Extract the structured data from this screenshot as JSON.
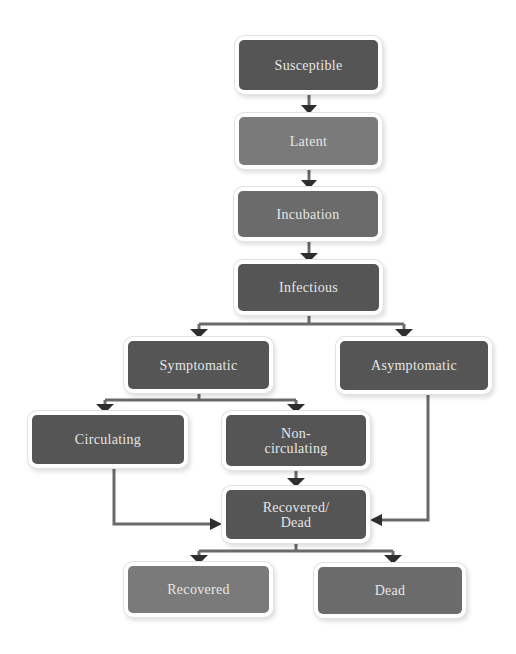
{
  "diagram": {
    "type": "flowchart",
    "colors": {
      "node_dark": "#555555",
      "node_mid": "#6b6b6b",
      "node_light": "#7a7a7a",
      "text": "#e6e6e6",
      "arrow": "#333333",
      "connector": "#6a6a6a"
    },
    "nodes": {
      "susceptible": "Susceptible",
      "latent": "Latent",
      "incubation": "Incubation",
      "infectious": "Infectious",
      "symptomatic": "Symptomatic",
      "asymptomatic": "Asymptomatic",
      "circulating": "Circulating",
      "non_circulating_1": "Non-",
      "non_circulating_2": "circulating",
      "recovered_dead_1": "Recovered/",
      "recovered_dead_2": "Dead",
      "recovered": "Recovered",
      "dead": "Dead"
    },
    "edges": [
      {
        "from": "Susceptible",
        "to": "Latent"
      },
      {
        "from": "Latent",
        "to": "Incubation"
      },
      {
        "from": "Incubation",
        "to": "Infectious"
      },
      {
        "from": "Infectious",
        "to": "Symptomatic"
      },
      {
        "from": "Infectious",
        "to": "Asymptomatic"
      },
      {
        "from": "Symptomatic",
        "to": "Circulating"
      },
      {
        "from": "Symptomatic",
        "to": "Non-circulating"
      },
      {
        "from": "Circulating",
        "to": "Recovered/Dead"
      },
      {
        "from": "Non-circulating",
        "to": "Recovered/Dead"
      },
      {
        "from": "Asymptomatic",
        "to": "Recovered/Dead"
      },
      {
        "from": "Recovered/Dead",
        "to": "Recovered"
      },
      {
        "from": "Recovered/Dead",
        "to": "Dead"
      }
    ]
  }
}
